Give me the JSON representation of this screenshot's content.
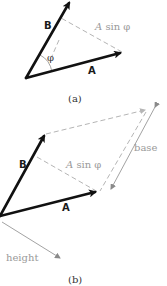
{
  "figure": {
    "panel_a": {
      "caption": "(a)",
      "vector_a_label": "A",
      "vector_b_label": "B",
      "projection_label_var": "A",
      "projection_label_fn": " sin φ",
      "angle_label": "φ"
    },
    "panel_b": {
      "caption": "(b)",
      "vector_a_label": "A",
      "vector_b_label": "B",
      "projection_label_var": "A",
      "projection_label_fn": " sin φ",
      "base_label": "base",
      "height_label": "height"
    },
    "colors": {
      "vector": "#111111",
      "construction": "#b5b5b5",
      "annotation_text": "#9a9a9a"
    }
  }
}
